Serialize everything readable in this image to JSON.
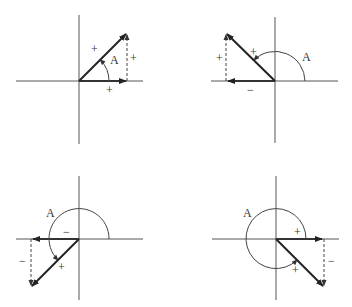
{
  "diagrams": [
    {
      "id": "quadrant-1",
      "origin": [
        79,
        81
      ],
      "tip": [
        127,
        33
      ],
      "angle_label": "A",
      "vector_sign": "+",
      "x_component_sign": "+",
      "y_component_sign": "+"
    },
    {
      "id": "quadrant-2",
      "origin": [
        275,
        81
      ],
      "tip": [
        226,
        33
      ],
      "angle_label": "A",
      "vector_sign": "+",
      "x_component_sign": "−",
      "y_component_sign": "+"
    },
    {
      "id": "quadrant-3",
      "origin": [
        79,
        239
      ],
      "tip": [
        31,
        287
      ],
      "angle_label": "A",
      "vector_sign": "+",
      "x_component_sign": "−",
      "y_component_sign": "−"
    },
    {
      "id": "quadrant-4",
      "origin": [
        276,
        239
      ],
      "tip": [
        324,
        287
      ],
      "angle_label": "A",
      "vector_sign": "+",
      "x_component_sign": "+",
      "y_component_sign": "−"
    }
  ]
}
